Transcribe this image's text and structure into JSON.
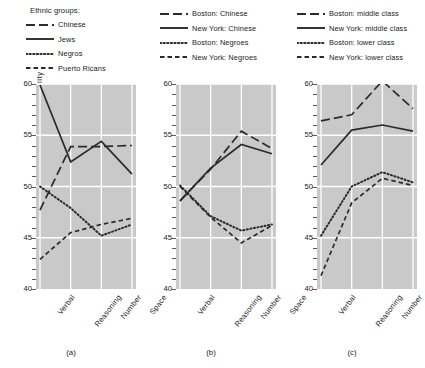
{
  "figure": {
    "axis_label_y": "Level  of  Ability",
    "x_categories": [
      "Verbal",
      "Reasoning",
      "Number",
      "Space"
    ],
    "y_ticks": [
      "40",
      "45",
      "50",
      "55",
      "60"
    ],
    "ylim": [
      40,
      60
    ],
    "background_color": "#c9c9c9",
    "grid_color": "#ffffff",
    "line_color": "#2b2b2b"
  },
  "panels": [
    {
      "id": "a",
      "caption": "(a)",
      "legend_title": "Ethnic groups:",
      "legend": [
        {
          "label": "Chinese",
          "style": "long-dash"
        },
        {
          "label": "Jews",
          "style": "solid"
        },
        {
          "label": "Negros",
          "style": "dotted"
        },
        {
          "label": "Puerto Ricans",
          "style": "short-dash"
        }
      ]
    },
    {
      "id": "b",
      "caption": "(b)",
      "legend_title": "",
      "legend": [
        {
          "label": "Boston:  Chinese",
          "style": "long-dash"
        },
        {
          "label": "New York:  Chinese",
          "style": "solid"
        },
        {
          "label": "Boston:  Negroes",
          "style": "dotted"
        },
        {
          "label": "New York:  Negroes",
          "style": "short-dash"
        }
      ]
    },
    {
      "id": "c",
      "caption": "(c)",
      "legend_title": "",
      "legend": [
        {
          "label": "Boston:  middle class",
          "style": "long-dash"
        },
        {
          "label": "New York:  middle class",
          "style": "solid"
        },
        {
          "label": "Boston:  lower class",
          "style": "dotted"
        },
        {
          "label": "New York:  lower class",
          "style": "short-dash"
        }
      ]
    }
  ],
  "chart_data": [
    {
      "type": "line",
      "title": "(a)",
      "xlabel": "",
      "ylabel": "Level of Ability",
      "categories": [
        "Verbal",
        "Reasoning",
        "Number",
        "Space"
      ],
      "ylim": [
        40,
        60
      ],
      "grid": true,
      "legend_position": "above",
      "series": [
        {
          "name": "Chinese",
          "style": "long-dash",
          "values": [
            47.7,
            53.9,
            53.9,
            54.0
          ]
        },
        {
          "name": "Jews",
          "style": "solid",
          "values": [
            59.9,
            52.4,
            54.4,
            51.2
          ]
        },
        {
          "name": "Negros",
          "style": "dotted",
          "values": [
            50.0,
            47.9,
            45.2,
            46.3
          ]
        },
        {
          "name": "Puerto Ricans",
          "style": "short-dash",
          "values": [
            42.9,
            45.5,
            46.3,
            46.9
          ]
        }
      ]
    },
    {
      "type": "line",
      "title": "(b)",
      "xlabel": "",
      "ylabel": "Level of Ability",
      "categories": [
        "Verbal",
        "Reasoning",
        "Number",
        "Space"
      ],
      "ylim": [
        40,
        60
      ],
      "grid": true,
      "legend_position": "above",
      "series": [
        {
          "name": "Boston: Chinese",
          "style": "long-dash",
          "values": [
            48.6,
            51.7,
            55.4,
            53.7
          ]
        },
        {
          "name": "New York: Chinese",
          "style": "solid",
          "values": [
            48.6,
            51.8,
            54.1,
            53.2
          ]
        },
        {
          "name": "Boston: Negroes",
          "style": "dotted",
          "values": [
            50.1,
            47.1,
            45.7,
            46.3
          ]
        },
        {
          "name": "New York: Negroes",
          "style": "short-dash",
          "values": [
            50.0,
            47.0,
            44.5,
            46.2
          ]
        }
      ]
    },
    {
      "type": "line",
      "title": "(c)",
      "xlabel": "",
      "ylabel": "Level of Ability",
      "categories": [
        "Verbal",
        "Reasoning",
        "Number",
        "Space"
      ],
      "ylim": [
        40,
        60
      ],
      "grid": true,
      "legend_position": "above",
      "series": [
        {
          "name": "Boston: middle class",
          "style": "long-dash",
          "values": [
            56.4,
            57.0,
            60.3,
            57.6
          ]
        },
        {
          "name": "New York: middle class",
          "style": "solid",
          "values": [
            52.1,
            55.5,
            56.0,
            55.4
          ]
        },
        {
          "name": "Boston: lower class",
          "style": "dotted",
          "values": [
            45.2,
            50.0,
            51.4,
            50.4
          ]
        },
        {
          "name": "New York: lower class",
          "style": "short-dash",
          "values": [
            41.3,
            48.4,
            50.8,
            50.1
          ]
        }
      ]
    }
  ]
}
